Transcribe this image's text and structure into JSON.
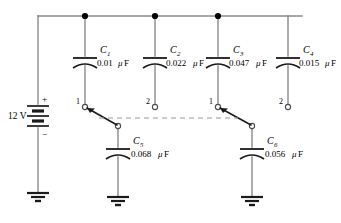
{
  "diagram": {
    "source": {
      "name": "battery",
      "voltage_label": "12 V",
      "plus_label": "+",
      "minus_label": "−"
    },
    "top_capacitors": [
      {
        "id": "C1",
        "name_text": "C",
        "subscript": "1",
        "value": "0.01",
        "unit_mu": "μ",
        "unit": "F",
        "value_full": "0.01 μF"
      },
      {
        "id": "C2",
        "name_text": "C",
        "subscript": "2",
        "value": "0.022",
        "unit_mu": "μ",
        "unit": "F",
        "value_full": "0.022 μF"
      },
      {
        "id": "C3",
        "name_text": "C",
        "subscript": "3",
        "value": "0.047",
        "unit_mu": "μ",
        "unit": "F",
        "value_full": "0.047 μF"
      },
      {
        "id": "C4",
        "name_text": "C",
        "subscript": "4",
        "value": "0.015",
        "unit_mu": "μ",
        "unit": "F",
        "value_full": "0.015 μF"
      }
    ],
    "bottom_capacitors": [
      {
        "id": "C5",
        "name_text": "C",
        "subscript": "5",
        "value": "0.068",
        "unit_mu": "μ",
        "unit": "F",
        "value_full": "0.068 μF"
      },
      {
        "id": "C6",
        "name_text": "C",
        "subscript": "6",
        "value": "0.056",
        "unit_mu": "μ",
        "unit": "F",
        "value_full": "0.056 μF"
      }
    ],
    "switch_terminals": [
      {
        "id": "sw1-pos1",
        "label": "1"
      },
      {
        "id": "sw1-pos2",
        "label": "2"
      },
      {
        "id": "sw2-pos1",
        "label": "1"
      },
      {
        "id": "sw2-pos2",
        "label": "2"
      }
    ],
    "grounds": [
      {
        "id": "ground-source"
      },
      {
        "id": "ground-c5"
      },
      {
        "id": "ground-c6"
      }
    ],
    "junction_dots": 3,
    "colors": {
      "wire": "#888a8c",
      "symbol": "#1a1a1a",
      "dashed": "#9a9a9a",
      "background": "#ffffff"
    }
  }
}
